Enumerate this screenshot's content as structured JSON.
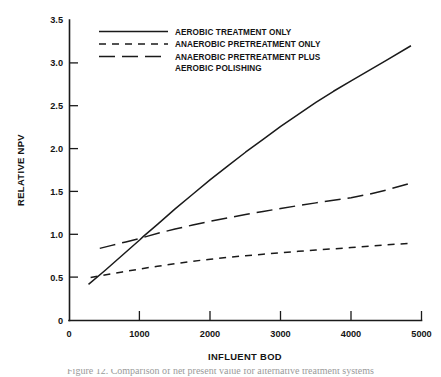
{
  "figure": {
    "background_color": "#ffffff",
    "ink_color": "#1a1a1a",
    "caption_partial": "Figure 12. Comparison of net present value for alternative treatment systems"
  },
  "chart_data": {
    "type": "line",
    "title": "",
    "subtitle": "",
    "xlabel": "INFLUENT BOD",
    "ylabel": "RELATIVE NPV",
    "xlim": [
      0,
      5000
    ],
    "ylim": [
      0,
      3.5
    ],
    "xticks": [
      0,
      1000,
      2000,
      3000,
      4000,
      5000
    ],
    "xtick_labels": [
      "0",
      "1000",
      "2000",
      "3000",
      "4000",
      "5000"
    ],
    "yticks": [
      0,
      0.5,
      1.0,
      1.5,
      2.0,
      2.5,
      3.0,
      3.5
    ],
    "ytick_labels": [
      "0",
      "0.5",
      "1.0",
      "1.5",
      "2.0",
      "2.5",
      "3.0",
      "3.5"
    ],
    "grid": false,
    "legend_position": "top-left-inside",
    "annotations": [],
    "series": [
      {
        "name": "AEROBIC TREATMENT ONLY",
        "style": "solid",
        "color": "#1a1a1a",
        "x": [
          270,
          500,
          750,
          1000,
          1050,
          1250,
          1500,
          1750,
          2000,
          2250,
          2500,
          2750,
          3000,
          3250,
          3500,
          3750,
          4000,
          4250,
          4500,
          4850
        ],
        "y": [
          0.42,
          0.58,
          0.76,
          0.94,
          0.98,
          1.12,
          1.3,
          1.47,
          1.64,
          1.8,
          1.96,
          2.11,
          2.26,
          2.4,
          2.54,
          2.67,
          2.79,
          2.91,
          3.03,
          3.2
        ]
      },
      {
        "name": "ANAEROBIC PRETREATMENT ONLY",
        "style": "dashed-short",
        "color": "#1a1a1a",
        "x": [
          300,
          500,
          750,
          1000,
          1250,
          1500,
          1750,
          2000,
          2250,
          2500,
          2750,
          3000,
          3250,
          3500,
          3750,
          4000,
          4250,
          4500,
          4850
        ],
        "y": [
          0.5,
          0.53,
          0.565,
          0.6,
          0.632,
          0.662,
          0.69,
          0.714,
          0.735,
          0.754,
          0.772,
          0.79,
          0.806,
          0.821,
          0.835,
          0.85,
          0.866,
          0.881,
          0.9
        ]
      },
      {
        "name": "ANAEROBIC PRETREATMENT PLUS AEROBIC POLISHING",
        "style": "dashed-long",
        "color": "#1a1a1a",
        "x": [
          430,
          600,
          800,
          1000,
          1100,
          1300,
          1500,
          1750,
          2000,
          2250,
          2500,
          2750,
          3000,
          3250,
          3500,
          3750,
          4000,
          4250,
          4500,
          4850
        ],
        "y": [
          0.84,
          0.875,
          0.915,
          0.955,
          0.98,
          1.025,
          1.065,
          1.112,
          1.155,
          1.196,
          1.234,
          1.27,
          1.305,
          1.338,
          1.37,
          1.4,
          1.43,
          1.47,
          1.52,
          1.6
        ]
      }
    ]
  },
  "legend": {
    "entries": [
      {
        "label": "AEROBIC TREATMENT ONLY",
        "style": "solid"
      },
      {
        "label": "ANAEROBIC PRETREATMENT ONLY",
        "style": "dashed-short"
      },
      {
        "label": "ANAEROBIC PRETREATMENT PLUS",
        "style": "dashed-long"
      },
      {
        "label": "AEROBIC POLISHING",
        "style": "none"
      }
    ]
  }
}
